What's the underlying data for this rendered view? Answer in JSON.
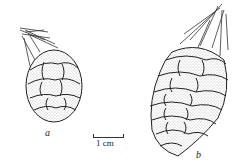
{
  "figure": {
    "labels": {
      "cone_a": "a",
      "cone_b": "b"
    },
    "scale_bar": {
      "label": "1 cm"
    },
    "colors": {
      "ink": "#222222",
      "paper": "#ffffff",
      "stipple": "#8a8a8a"
    }
  }
}
